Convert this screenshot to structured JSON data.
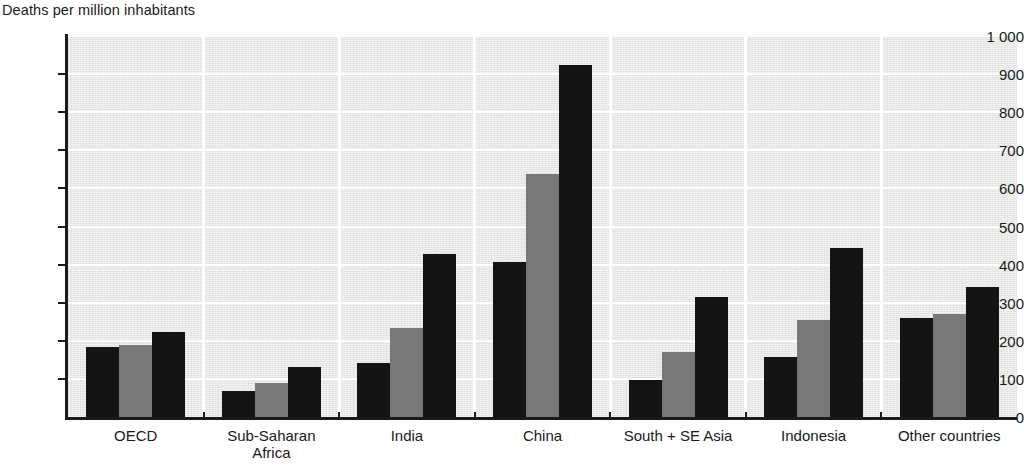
{
  "chart_data": {
    "type": "bar",
    "title": "Deaths per million inhabitants",
    "xlabel": "",
    "ylabel": "",
    "ylim": [
      0,
      1000
    ],
    "yticks": [
      0,
      100,
      200,
      300,
      400,
      500,
      600,
      700,
      800,
      900,
      1000
    ],
    "ytick_labels": [
      "0",
      "100",
      "200",
      "300",
      "400",
      "500",
      "600",
      "700",
      "800",
      "900",
      "1 000"
    ],
    "grid": true,
    "legend": "none",
    "categories": [
      "OECD",
      "Sub-Saharan Africa",
      "India",
      "China",
      "South + SE Asia",
      "Indonesia",
      "Other countries"
    ],
    "category_lines": [
      [
        "OECD"
      ],
      [
        "Sub-Saharan",
        "Africa"
      ],
      [
        "India"
      ],
      [
        "China"
      ],
      [
        "South + SE Asia"
      ],
      [
        "Indonesia"
      ],
      [
        "Other countries"
      ]
    ],
    "series": [
      {
        "name": "series-1",
        "color": "#141414",
        "values": [
          183,
          68,
          142,
          408,
          96,
          157,
          260
        ]
      },
      {
        "name": "series-2",
        "color": "#787878",
        "values": [
          189,
          89,
          234,
          638,
          170,
          255,
          270
        ]
      },
      {
        "name": "series-3",
        "color": "#141414",
        "values": [
          223,
          130,
          428,
          925,
          315,
          443,
          341
        ]
      }
    ]
  },
  "colors": {
    "plot_background": "#e7e7e7",
    "gridline": "#ffffff",
    "axis": "#1a1a1a",
    "bar_dark": "#141414",
    "bar_mid": "#787878",
    "text": "#1a1a1a"
  }
}
